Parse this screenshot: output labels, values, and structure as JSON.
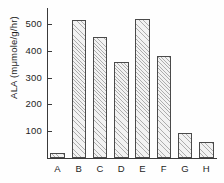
{
  "chart_data": {
    "type": "bar",
    "title": "",
    "subtitle": "",
    "xlabel": "",
    "ylabel": "ALA (mμmole/g/hr)",
    "categories": [
      "A",
      "B",
      "C",
      "D",
      "E",
      "F",
      "G",
      "H"
    ],
    "values": [
      20,
      515,
      450,
      360,
      520,
      380,
      95,
      58
    ],
    "ylim": [
      0,
      560
    ],
    "yticks": [
      100,
      200,
      300,
      400,
      500
    ],
    "ytick_labels": [
      "100",
      "200",
      "300",
      "400",
      "500"
    ],
    "grid": false,
    "legend": null,
    "annotations": [],
    "series": [
      {
        "name": "ALA",
        "values": [
          20,
          515,
          450,
          360,
          520,
          380,
          95,
          58
        ]
      }
    ]
  },
  "style": {
    "axis_color": "#3a3a3a",
    "bar_edge_color": "#4a4a4a",
    "bar_fill_color": "#f2f2f2",
    "hatch": "diagonal-crosshatch",
    "text_color": "#1d1d1d",
    "background": "#ffffff"
  }
}
